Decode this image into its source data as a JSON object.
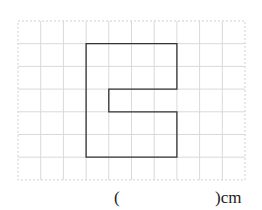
{
  "grid": {
    "x0": 18,
    "y0": 21,
    "cell": 22.7,
    "cols": 10,
    "rows": 7,
    "line_color": "#d9d9d9",
    "border_color": "#cfcfcf"
  },
  "shape": {
    "points_cells": [
      [
        3,
        1
      ],
      [
        7,
        1
      ],
      [
        7,
        3
      ],
      [
        4,
        3
      ],
      [
        4,
        4
      ],
      [
        7,
        4
      ],
      [
        7,
        6
      ],
      [
        3,
        6
      ]
    ],
    "stroke": "#333333"
  },
  "answer": {
    "open_paren": "(",
    "close_unit": ")cm"
  }
}
